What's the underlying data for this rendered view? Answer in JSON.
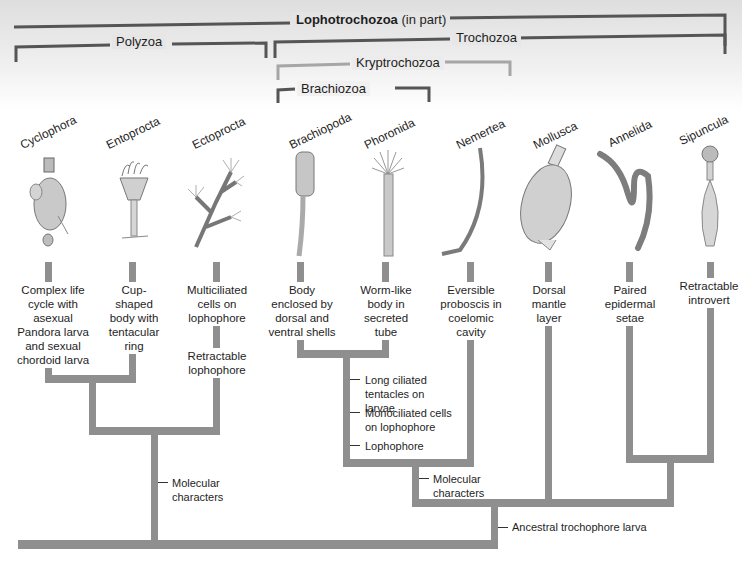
{
  "clades": {
    "lophotrochozoa": {
      "name": "Lophotrochozoa",
      "qualifier": "(in part)"
    },
    "polyzoa": "Polyzoa",
    "trochozoa": "Trochozoa",
    "kryptrochozoa": "Kryptrochozoa",
    "brachiozoa": "Brachiozoa"
  },
  "taxa": [
    {
      "name": "Cyclophora",
      "character": "Complex life cycle with asexual Pandora larva and sexual chordoid larva"
    },
    {
      "name": "Entoprocta",
      "character": "Cup-shaped body with tentacular ring"
    },
    {
      "name": "Ectoprocta",
      "character": "Multiciliated cells on lophophore",
      "character2": "Retractable lophophore"
    },
    {
      "name": "Brachiopoda",
      "character": "Body enclosed by dorsal and ventral shells"
    },
    {
      "name": "Phoronida",
      "character": "Worm-like body in secreted tube"
    },
    {
      "name": "Nemertea",
      "character": "Eversible proboscis in coelomic cavity"
    },
    {
      "name": "Mollusca",
      "character": "Dorsal mantle layer"
    },
    {
      "name": "Annelida",
      "character": "Paired epidermal setae"
    },
    {
      "name": "Sipuncula",
      "character": "Retractable introvert"
    }
  ],
  "node_characters": {
    "polyzoa_node": "Molecular characters",
    "lophophorate_node": [
      "Long ciliated tentacles on larvae",
      "Monociliated  cells on lophophore",
      "Lophophore"
    ],
    "kryptrochozoa_node": "Molecular characters",
    "trochozoa_node": "Ancestral trochophore larva"
  },
  "colors": {
    "branch": "#8f8f8f",
    "bracket_dark": "#555555",
    "bracket_light": "#a6a6a6",
    "header_band": "#e4e4e4"
  }
}
